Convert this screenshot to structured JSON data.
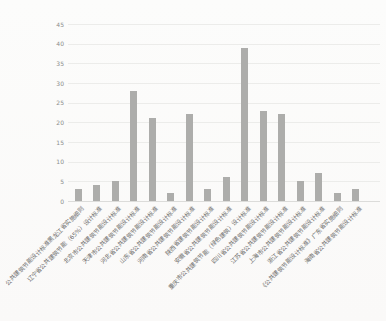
{
  "chart_data": {
    "type": "bar",
    "title": "",
    "xlabel": "",
    "ylabel": "",
    "categories": [
      "公共建筑节能设计标准黑龙江省实施细则",
      "辽宁省公共建筑节能（65%）设计标准",
      "北京市公共建筑节能设计标准",
      "天津市公共建筑节能设计标准",
      "河北省公共建筑节能设计标准",
      "山东省公共建筑节能设计标准",
      "河南省公共建筑节能设计标准",
      "陕西省建筑节能设计标准",
      "安徽省公共建筑节能设计标准",
      "重庆市公共建筑节能（绿色建筑）设计标准",
      "四川省公共建筑节能设计标准",
      "江苏省公共建筑节能设计标准",
      "上海市公共建筑节能设计标准",
      "浙江省公共建筑节能设计标准",
      "《公共建筑节能设计标准》广东省实施细则",
      "海南省公共建筑节能设计标准"
    ],
    "values": [
      3,
      4,
      5,
      28,
      21,
      2,
      22,
      3,
      6,
      39,
      23,
      22,
      5,
      7,
      2,
      3
    ],
    "ylim": [
      0,
      45
    ],
    "yticks": [
      0,
      5,
      10,
      15,
      20,
      25,
      30,
      35,
      40,
      45
    ],
    "grid": true,
    "legend_position": "none",
    "bar_color": "#adadab",
    "gridline_color": "#ececea",
    "axis_line_color": "#dcdcda",
    "ytick_label_color": "#8c8c8c",
    "xtick_label_color": "#6b6b69"
  }
}
